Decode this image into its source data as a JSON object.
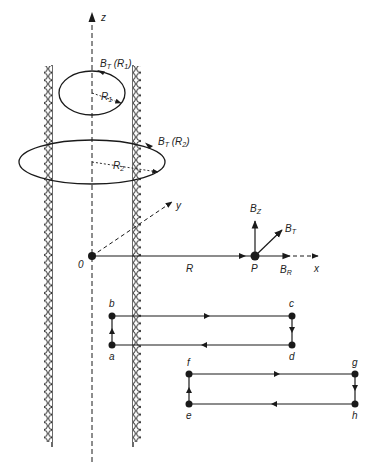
{
  "diagram": {
    "type": "physics-solenoid-field",
    "axes": {
      "z_label": "z",
      "y_label": "y",
      "x_label": "x",
      "origin_label": "0"
    },
    "loops_inside": [
      {
        "radius_label": "R",
        "radius_sub": "1",
        "field_label": "B",
        "field_sub": "T",
        "field_arg": "(R",
        "field_arg_sub": "1",
        "field_arg_close": ")"
      },
      {
        "radius_label": "R",
        "radius_sub": "2",
        "field_label": "B",
        "field_sub": "T",
        "field_arg": "(R",
        "field_arg_sub": "2",
        "field_arg_close": ")"
      }
    ],
    "radial_axis_label": "R",
    "point": {
      "label": "P",
      "components": [
        {
          "base": "B",
          "sub": "Z"
        },
        {
          "base": "B",
          "sub": "T"
        },
        {
          "base": "B",
          "sub": "R"
        }
      ]
    },
    "rect_loop_1": {
      "corners": [
        "a",
        "b",
        "c",
        "d"
      ]
    },
    "rect_loop_2": {
      "corners": [
        "e",
        "f",
        "g",
        "h"
      ]
    },
    "colors": {
      "ink": "#1a1a1a",
      "background": "#ffffff"
    }
  }
}
